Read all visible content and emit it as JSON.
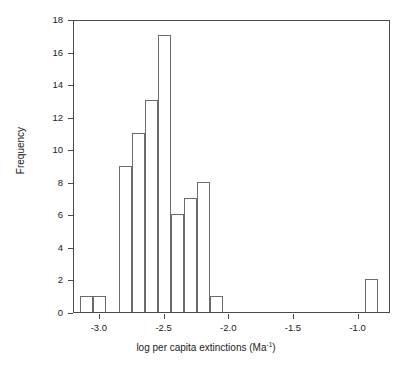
{
  "chart_data": {
    "type": "bar",
    "title": "",
    "subtitle": "",
    "xlabel_text": "log per capita extinctions (Ma",
    "xlabel_sup": "-1",
    "xlabel_tail": ")",
    "xlabel_full": "log per capita extinctions (Ma⁻¹)",
    "ylabel": "Frequency",
    "xlim": [
      -3.2,
      -0.75
    ],
    "ylim": [
      0,
      18
    ],
    "bin_width": 0.1,
    "grid": false,
    "legend": null,
    "xticks": [
      -3.0,
      -2.5,
      -2.0,
      -1.5,
      -1.0
    ],
    "xtick_labels": [
      "-3.0",
      "-2.5",
      "-2.0",
      "-1.5",
      "-1.0"
    ],
    "yticks": [
      0,
      2,
      4,
      6,
      8,
      10,
      12,
      14,
      16,
      18
    ],
    "ytick_labels": [
      "0",
      "2",
      "4",
      "6",
      "8",
      "10",
      "12",
      "14",
      "16",
      "18"
    ],
    "bins": [
      {
        "x0": -3.15,
        "x1": -3.05,
        "value": 1
      },
      {
        "x0": -3.05,
        "x1": -2.95,
        "value": 1
      },
      {
        "x0": -2.95,
        "x1": -2.85,
        "value": 0
      },
      {
        "x0": -2.85,
        "x1": -2.75,
        "value": 9
      },
      {
        "x0": -2.75,
        "x1": -2.65,
        "value": 11
      },
      {
        "x0": -2.65,
        "x1": -2.55,
        "value": 13
      },
      {
        "x0": -2.55,
        "x1": -2.45,
        "value": 17
      },
      {
        "x0": -2.45,
        "x1": -2.35,
        "value": 6
      },
      {
        "x0": -2.35,
        "x1": -2.25,
        "value": 7
      },
      {
        "x0": -2.25,
        "x1": -2.15,
        "value": 8
      },
      {
        "x0": -2.15,
        "x1": -2.05,
        "value": 1
      },
      {
        "x0": -2.05,
        "x1": -1.95,
        "value": 0
      },
      {
        "x0": -1.95,
        "x1": -1.85,
        "value": 0
      },
      {
        "x0": -1.85,
        "x1": -1.75,
        "value": 0
      },
      {
        "x0": -1.75,
        "x1": -1.65,
        "value": 0
      },
      {
        "x0": -1.65,
        "x1": -1.55,
        "value": 0
      },
      {
        "x0": -1.55,
        "x1": -1.45,
        "value": 0
      },
      {
        "x0": -1.45,
        "x1": -1.35,
        "value": 0
      },
      {
        "x0": -1.35,
        "x1": -1.25,
        "value": 0
      },
      {
        "x0": -1.25,
        "x1": -1.15,
        "value": 0
      },
      {
        "x0": -1.15,
        "x1": -1.05,
        "value": 0
      },
      {
        "x0": -1.05,
        "x1": -0.95,
        "value": 0
      },
      {
        "x0": -0.95,
        "x1": -0.85,
        "value": 2
      }
    ],
    "values": [
      1,
      1,
      0,
      9,
      11,
      13,
      17,
      6,
      7,
      8,
      1,
      0,
      0,
      0,
      0,
      0,
      0,
      0,
      0,
      0,
      0,
      0,
      2
    ],
    "colors": {
      "axis": "#4a4a4a",
      "bar_stroke": "#6b6b6b",
      "bar_fill": "none",
      "text": "#1a1a1a",
      "background": "#ffffff"
    }
  }
}
